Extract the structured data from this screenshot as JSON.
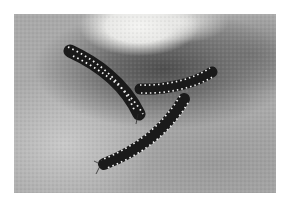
{
  "image": {
    "subject": "three millipedes on a rough stone surface",
    "style": "black-and-white photograph",
    "colors": {
      "background": "#ffffff",
      "stone_light": "#c8c8c8",
      "stone_mid": "#a9a9a9",
      "shadow": "#4e4e4e",
      "millipede_body": "#1a1a1a",
      "millipede_spots": "#f2f2f2"
    }
  }
}
